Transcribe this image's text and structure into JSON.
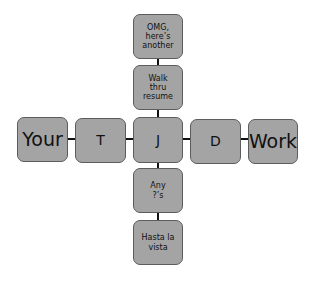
{
  "diagram": {
    "type": "cross-flow",
    "colors": {
      "node_fill": "#a4a4a4",
      "node_border": "#5c5c5c",
      "connector": "#111111",
      "text": "#111111"
    },
    "horizontal": [
      {
        "id": "your",
        "label": "Your"
      },
      {
        "id": "t",
        "label": "T"
      },
      {
        "id": "j",
        "label": "J"
      },
      {
        "id": "d",
        "label": "D"
      },
      {
        "id": "work",
        "label": "Work"
      }
    ],
    "vertical_top": [
      {
        "id": "omg",
        "label": "OMG,\nhere’s\nanother"
      },
      {
        "id": "walk",
        "label": "Walk\nthru\nresume"
      }
    ],
    "vertical_bottom": [
      {
        "id": "any",
        "label": "Any\n?’s"
      },
      {
        "id": "hasta",
        "label": "Hasta la\nvista"
      }
    ],
    "edges": [
      [
        "your",
        "t"
      ],
      [
        "t",
        "j"
      ],
      [
        "j",
        "d"
      ],
      [
        "d",
        "work"
      ],
      [
        "omg",
        "walk"
      ],
      [
        "walk",
        "j"
      ],
      [
        "j",
        "any"
      ],
      [
        "any",
        "hasta"
      ]
    ]
  }
}
